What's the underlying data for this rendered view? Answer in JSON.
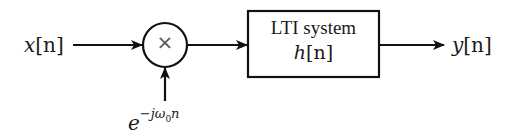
{
  "diagram": {
    "type": "signal-flow block diagram",
    "input": {
      "var": "x",
      "index": "[n]"
    },
    "multiplier": {
      "symbol": "×"
    },
    "modulating_signal": {
      "base": "e",
      "exponent_prefix": "−jω",
      "exponent_sub": "0",
      "exponent_suffix": "n"
    },
    "block": {
      "title": "LTI system",
      "impulse_response": {
        "var": "h",
        "index": "[n]"
      }
    },
    "output": {
      "var": "y",
      "index": "[n]"
    },
    "colors": {
      "stroke": "#111111",
      "text": "#1a1a1a",
      "background": "#ffffff"
    }
  }
}
